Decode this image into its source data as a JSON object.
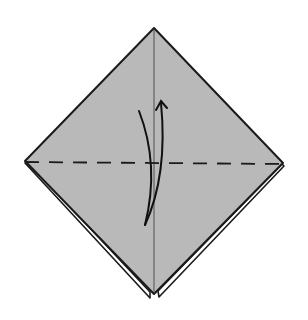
{
  "diagram": {
    "type": "origami-step",
    "description": "Square base (preliminary fold) seen as a diamond; valley fold along horizontal dashed line, flipping the bottom flap up",
    "colors": {
      "paper": "#b9b9b9",
      "outline": "#1a1a1a",
      "background": "#ffffff",
      "under_layer": "#ffffff"
    },
    "shape": {
      "top": [
        154,
        28
      ],
      "left": [
        25,
        161
      ],
      "right": [
        283,
        163
      ],
      "bottom": [
        152,
        296
      ]
    },
    "fold_line": {
      "style": "dashed",
      "kind": "valley-fold",
      "from": [
        25,
        162
      ],
      "to": [
        283,
        164
      ]
    },
    "center_crease": {
      "from": [
        154,
        28
      ],
      "to": [
        154,
        296
      ]
    },
    "arrow": {
      "kind": "fold-up",
      "direction": "up",
      "tip": [
        161,
        100
      ]
    }
  }
}
